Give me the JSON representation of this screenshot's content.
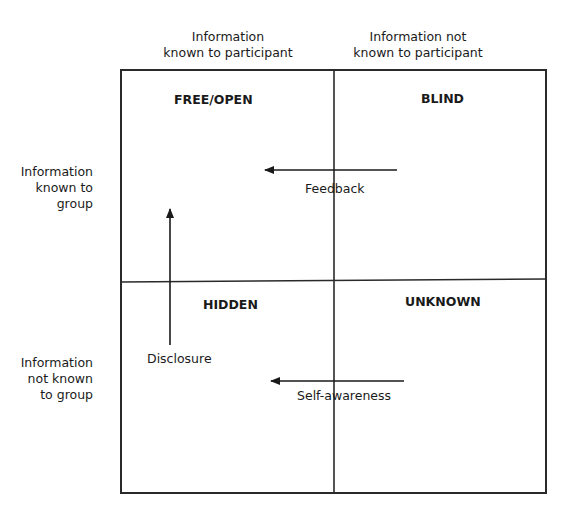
{
  "diagram": {
    "columns": [
      {
        "label_line1": "Information",
        "label_line2": "known to participant"
      },
      {
        "label_line1": "Information not",
        "label_line2": "known to participant"
      }
    ],
    "rows": [
      {
        "label_line1": "Information",
        "label_line2": "known to",
        "label_line3": "group"
      },
      {
        "label_line1": "Information",
        "label_line2": "not known",
        "label_line3": "to group"
      }
    ],
    "quadrants": {
      "top_left": "FREE/OPEN",
      "top_right": "BLIND",
      "bottom_left": "HIDDEN",
      "bottom_right": "UNKNOWN"
    },
    "arrows": {
      "feedback": "Feedback",
      "disclosure": "Disclosure",
      "self_awareness": "Self-awareness"
    },
    "colors": {
      "line": "#2a2a2a",
      "text": "#1a1a1a",
      "background": "#ffffff"
    }
  }
}
